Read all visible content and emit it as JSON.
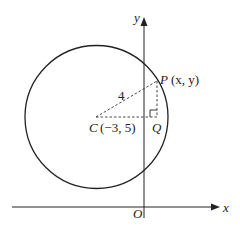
{
  "diagram": {
    "axes": {
      "x_label": "x",
      "y_label": "y",
      "origin_label": "O"
    },
    "circle": {
      "center_label": "C",
      "center_coords": "(−3, 5)",
      "radius_label": "4"
    },
    "point_p": {
      "label": "P",
      "coords": "(x, y)"
    },
    "point_q": {
      "label": "Q"
    },
    "colors": {
      "stroke": "#222222",
      "background": "#ffffff"
    }
  }
}
